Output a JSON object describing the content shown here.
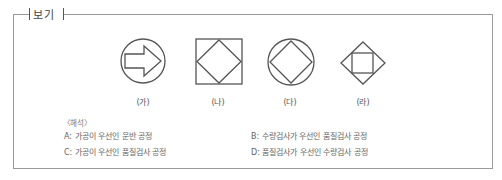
{
  "header": {
    "title": "보기"
  },
  "figures": [
    {
      "label": "(가)",
      "icon": "circle-with-arrow"
    },
    {
      "label": "(나)",
      "icon": "square-with-diamond"
    },
    {
      "label": "(다)",
      "icon": "circle-with-diamond"
    },
    {
      "label": "(라)",
      "icon": "diamond-with-square"
    }
  ],
  "interpretation": {
    "title": "〈해석〉",
    "items": [
      "A: 가공이 우선인 운반 공정",
      "B: 수량검사가 우선인 품질검사 공정",
      "C: 가공이 우선인 품질검사 공정",
      "D: 품질검사가 우선인 수량검사 공정"
    ]
  },
  "colors": {
    "border": "#9a9a9a",
    "stroke": "#555555",
    "text": "#666666"
  }
}
